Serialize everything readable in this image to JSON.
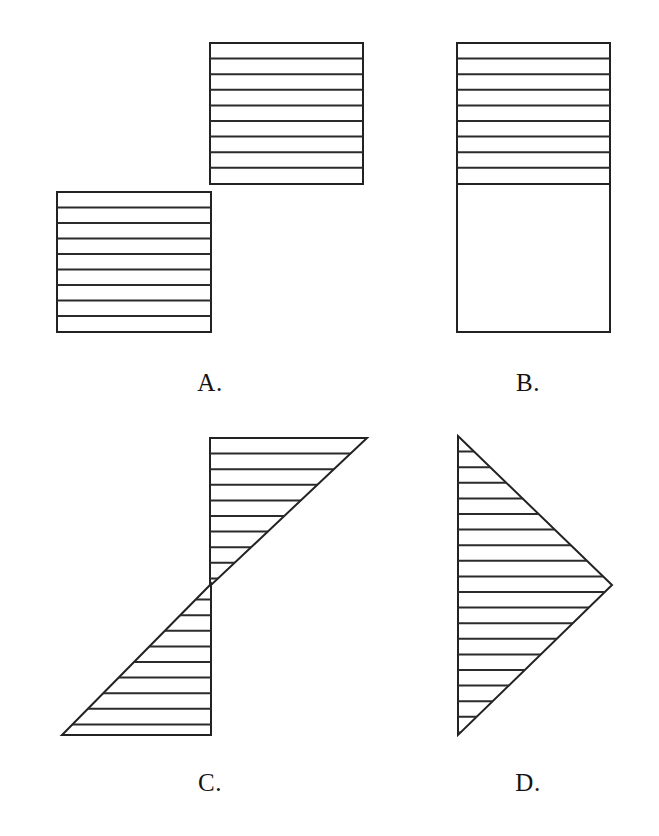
{
  "page": {
    "width": 659,
    "height": 836,
    "background_color": "#ffffff",
    "stroke_color": "#222222",
    "hatch_color": "#2b2b2b"
  },
  "figures": [
    {
      "id": "figure-a",
      "label": "A.",
      "label_x": 210,
      "label_y": 390,
      "shape": "two-offset-squares-staircase",
      "fill": "horizontal-hatch",
      "hatch_spacing": 15.6,
      "parts": [
        {
          "name": "upper-square",
          "x": 210,
          "y": 43,
          "width": 153,
          "height": 141,
          "hatched": true,
          "hatch_lines": 9
        },
        {
          "name": "lower-square",
          "x": 57,
          "y": 192,
          "width": 154,
          "height": 140,
          "hatched": true,
          "hatch_lines": 9
        }
      ]
    },
    {
      "id": "figure-b",
      "label": "B.",
      "label_x": 528,
      "label_y": 390,
      "shape": "tall-rectangle-top-half-hatched",
      "fill": "horizontal-hatch-upper-portion",
      "hatch_spacing": 15.6,
      "parts": [
        {
          "name": "rectangle-outline",
          "x": 457,
          "y": 43,
          "width": 153,
          "height": 289,
          "hatched": false
        },
        {
          "name": "hatched-upper-band",
          "x": 457,
          "y": 43,
          "width": 153,
          "height": 141,
          "hatched": true,
          "hatch_lines": 9
        },
        {
          "name": "blank-lower-band",
          "x": 457,
          "y": 184,
          "width": 153,
          "height": 148,
          "hatched": false
        }
      ]
    },
    {
      "id": "figure-c",
      "label": "C.",
      "label_x": 210,
      "label_y": 790,
      "shape": "two-opposed-right-triangles-z-form",
      "fill": "horizontal-hatch",
      "hatch_spacing": 15.6,
      "parts": [
        {
          "name": "upper-right-triangle",
          "hatched": true,
          "points": "210,438 367,438 210,586"
        },
        {
          "name": "lower-left-triangle",
          "hatched": true,
          "points": "211,584 211,735 62,735"
        }
      ]
    },
    {
      "id": "figure-d",
      "label": "D.",
      "label_x": 528,
      "label_y": 790,
      "shape": "right-pointing-triangle",
      "fill": "horizontal-hatch",
      "hatch_spacing": 15.6,
      "parts": [
        {
          "name": "triangle",
          "hatched": true,
          "points": "458,436 612,585 458,735"
        }
      ]
    }
  ],
  "labels": {
    "a": "A.",
    "b": "B.",
    "c": "C.",
    "d": "D."
  }
}
